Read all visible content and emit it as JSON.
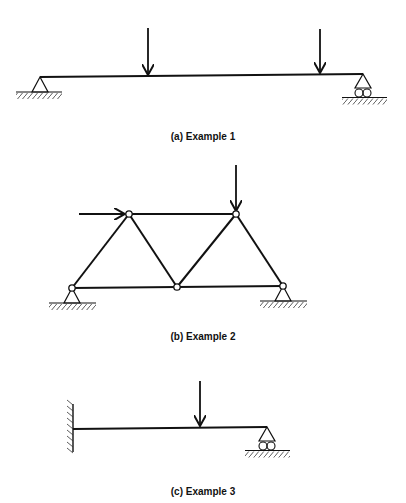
{
  "figure": {
    "cropped_top_text": "",
    "panels": [
      {
        "id": "a",
        "caption": "(a) Example 1",
        "type": "simply-supported beam",
        "supports": [
          "pin (left)",
          "roller (right)"
        ],
        "loads": [
          "downward point load at ~1/3 span",
          "downward point load near right support"
        ]
      },
      {
        "id": "b",
        "caption": "(b) Example 2",
        "type": "truss",
        "joints": 5,
        "members": 7,
        "supports": [
          "pin (bottom-left)",
          "pin (bottom-right)"
        ],
        "loads": [
          "horizontal rightward load at top-left joint",
          "downward load at top-right joint"
        ]
      },
      {
        "id": "c",
        "caption": "(c) Example 3",
        "type": "propped cantilever beam",
        "supports": [
          "fixed wall (left)",
          "roller (right)"
        ],
        "loads": [
          "downward point load at ~2/3 span"
        ]
      }
    ]
  },
  "colors": {
    "ink": "#111111",
    "background": "#ffffff"
  }
}
